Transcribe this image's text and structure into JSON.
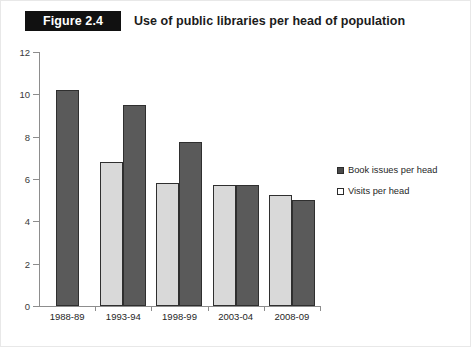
{
  "header": {
    "badge": "Figure 2.4",
    "title": "Use of public libraries per head of population"
  },
  "chart_data": {
    "type": "bar",
    "title": "Use of public libraries per head of population",
    "xlabel": "",
    "ylabel": "",
    "ylim": [
      0,
      12
    ],
    "yticks": [
      0,
      2,
      4,
      6,
      8,
      10,
      12
    ],
    "ytick_labels": [
      "0",
      "2",
      "4",
      "6",
      "8",
      "10",
      "12"
    ],
    "grid": false,
    "legend_position": "right",
    "categories": [
      "1988-89",
      "1993-94",
      "1998-99",
      "2003-04",
      "2008-09"
    ],
    "series": [
      {
        "name": "Book issues per head",
        "color": "#5a5a5a",
        "values": [
          10.2,
          9.5,
          7.75,
          5.7,
          5.0
        ]
      },
      {
        "name": "Visits per head",
        "color": "#d9d9d9",
        "values": [
          null,
          6.8,
          5.8,
          5.7,
          5.25
        ]
      }
    ]
  },
  "legend": {
    "items": [
      {
        "label": "Book issues per head",
        "swatch": "dark"
      },
      {
        "label": "Visits per head",
        "swatch": "light"
      }
    ]
  }
}
